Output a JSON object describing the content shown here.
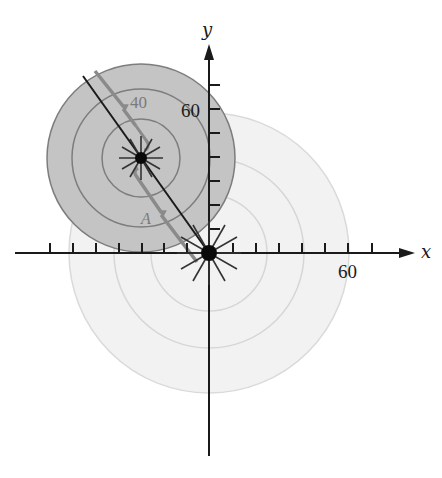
{
  "diagram": {
    "axes": {
      "x_label": "x",
      "y_label": "y",
      "x_tick_label": "60",
      "y_tick_label": "60",
      "unit_per_tick": 10
    },
    "origin_source": {
      "label": "",
      "faint_ring_radii_px": [
        58,
        95,
        140
      ],
      "color": "#dcdcdc"
    },
    "moving_source": {
      "ring_radii_px": [
        39,
        69,
        94
      ],
      "fill_color": "#c2c2c2",
      "ring_color": "#7d7d7d"
    },
    "labels": {
      "ring_label": "40",
      "point_label": "A"
    },
    "colors": {
      "axis": "#1a1a1a",
      "path_line": "#1a1a1a",
      "wavefront_line": "#8a8a8a",
      "faint_ring": "#d9d9d9",
      "faint_fill": "#f1f1f1"
    }
  }
}
